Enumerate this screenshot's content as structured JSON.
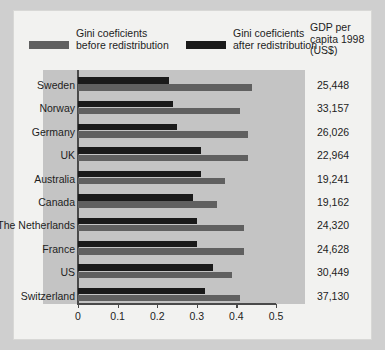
{
  "legend": {
    "before": {
      "label": "Gini coeficients\nbefore redistribution",
      "color": "#606060",
      "swatch_name": "legend-swatch-before"
    },
    "after": {
      "label": "Gini coeficients\nafter redistribution",
      "color": "#1a1a1a",
      "swatch_name": "legend-swatch-after"
    },
    "gdp_header": "GDP per\ncapita 1998\n(US$)"
  },
  "axis": {
    "ticks": [
      "0",
      "0.1",
      "0.2",
      "0.3",
      "0.4",
      "0.5"
    ],
    "min": 0,
    "max": 0.5
  },
  "chart_data": {
    "type": "bar",
    "orientation": "horizontal",
    "title": "",
    "xlabel": "",
    "ylabel": "",
    "xlim": [
      0,
      0.5
    ],
    "grid": false,
    "legend_position": "top",
    "categories": [
      "Sweden",
      "Norway",
      "Germany",
      "UK",
      "Australia",
      "Canada",
      "The Netherlands",
      "France",
      "US",
      "Switzerland"
    ],
    "series": [
      {
        "name": "Gini coeficients after redistribution",
        "color": "#1a1a1a",
        "values": [
          0.23,
          0.24,
          0.25,
          0.31,
          0.31,
          0.29,
          0.3,
          0.3,
          0.34,
          0.32
        ]
      },
      {
        "name": "Gini coeficients before redistribution",
        "color": "#606060",
        "values": [
          0.44,
          0.41,
          0.43,
          0.43,
          0.37,
          0.35,
          0.42,
          0.42,
          0.39,
          0.41
        ]
      }
    ],
    "annotations": {
      "label": "GDP per capita 1998 (US$)",
      "values": [
        "25,448",
        "33,157",
        "26,026",
        "22,964",
        "19,241",
        "19,162",
        "24,320",
        "24,628",
        "30,449",
        "37,130"
      ]
    }
  }
}
